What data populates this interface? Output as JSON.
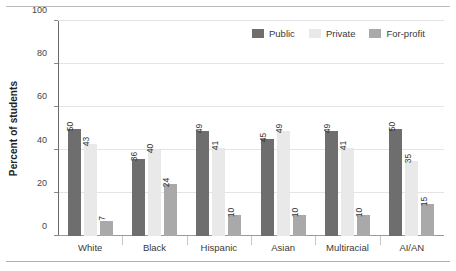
{
  "chart_data": {
    "type": "bar",
    "title": "",
    "subtitle": "",
    "xlabel": "",
    "ylabel": "Percent of students",
    "ylim": [
      0,
      100
    ],
    "yticks": [
      0,
      20,
      40,
      60,
      80,
      100
    ],
    "ytick_labels": [
      "0",
      "20",
      "40",
      "60",
      "80",
      "100"
    ],
    "grid": true,
    "legend_position": "top-right",
    "categories": [
      "White",
      "Black",
      "Hispanic",
      "Asian",
      "Multiracial",
      "AI/AN"
    ],
    "series": [
      {
        "name": "Public",
        "color": "#6e6e6e",
        "values": [
          50,
          36,
          49,
          45,
          49,
          50
        ]
      },
      {
        "name": "Private",
        "color": "#e9e9e9",
        "values": [
          43,
          40,
          41,
          49,
          41,
          35
        ]
      },
      {
        "name": "For-profit",
        "color": "#a9a9a9",
        "values": [
          7,
          24,
          10,
          10,
          10,
          15
        ]
      }
    ],
    "value_labels_rotated": true
  },
  "legend": {
    "items": [
      {
        "label": "Public",
        "color": "#6e6e6e"
      },
      {
        "label": "Private",
        "color": "#e9e9e9"
      },
      {
        "label": "For-profit",
        "color": "#a9a9a9"
      }
    ]
  },
  "axes": {
    "y_title": "Percent of students"
  }
}
